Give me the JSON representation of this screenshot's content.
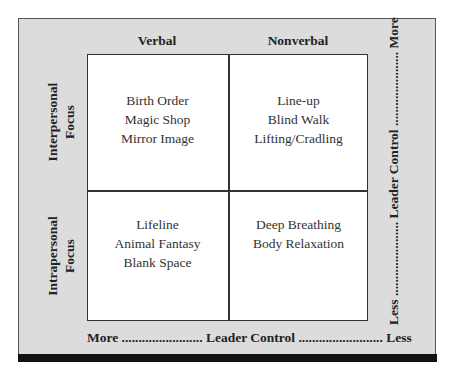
{
  "columns": [
    "Verbal",
    "Nonverbal"
  ],
  "rows": [
    {
      "label_line1": "Interpersonal",
      "label_line2": "Focus"
    },
    {
      "label_line1": "Intrapersonal",
      "label_line2": "Focus"
    }
  ],
  "cells": {
    "interpersonal_verbal": [
      "Birth Order",
      "Magic Shop",
      "Mirror Image"
    ],
    "interpersonal_nonverbal": [
      "Line-up",
      "Blind Walk",
      "Lifting/Cradling"
    ],
    "intrapersonal_verbal": [
      "Lifeline",
      "Animal Fantasy",
      "Blank Space"
    ],
    "intrapersonal_nonverbal": [
      "Deep Breathing",
      "Body Relaxation"
    ]
  },
  "axes": {
    "bottom": "More ........................ Leader Control ......................... Less",
    "right": "Less ...................... Leader Control ...................... More"
  },
  "colors": {
    "frame_bg": "#dcdcdc",
    "cell_bg": "#ffffff",
    "bar": "#111111"
  }
}
